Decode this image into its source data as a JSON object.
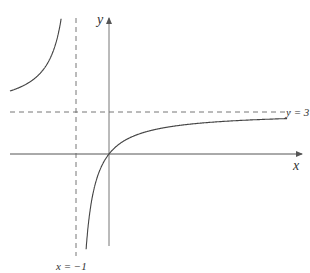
{
  "diagram": {
    "type": "function-graph",
    "function": "y = 3x/(x+1)",
    "axes": {
      "x_label": "x",
      "y_label": "y"
    },
    "asymptotes": {
      "vertical": {
        "label": "x = −1",
        "value": -1
      },
      "horizontal": {
        "label": "y = 3",
        "value": 3
      }
    },
    "colors": {
      "axis": "#555555",
      "curve": "#444444",
      "asymptote": "#666666",
      "text": "#333333"
    }
  },
  "chart_data": {
    "type": "line",
    "title": "",
    "xlabel": "x",
    "ylabel": "y",
    "function": "y = 3x/(x+1)",
    "vertical_asymptote": -1,
    "horizontal_asymptote": 3,
    "annotations": [
      "x = −1",
      "y = 3"
    ],
    "grid": false
  }
}
